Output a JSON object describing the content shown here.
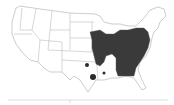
{
  "map": {
    "title": "",
    "region": "Contiguous United States",
    "colors": {
      "background": "#ffffff",
      "state_fill": "#ffffff",
      "state_border": "#9a9a9a",
      "range_fill": "#3a3a3a",
      "dot_fill": "#2a2a2a"
    },
    "shaded_region": "Eastern United States (Midwest, Southeast, Mid-Atlantic)",
    "isolated_points": [
      {
        "label": "Oklahoma / Arkansas border"
      },
      {
        "label": "East Texas"
      },
      {
        "label": "Louisiana"
      }
    ]
  }
}
